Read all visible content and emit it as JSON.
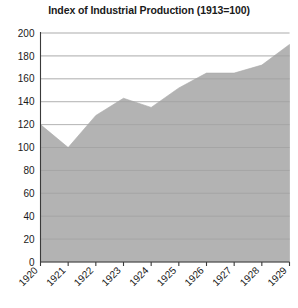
{
  "chart_data": {
    "type": "area",
    "title": "Index of Industrial Production (1913=100)",
    "xlabel": "",
    "ylabel": "",
    "categories": [
      "1920",
      "1921",
      "1922",
      "1923",
      "1924",
      "1925",
      "1926",
      "1927",
      "1928",
      "1929"
    ],
    "values": [
      120,
      100,
      128,
      143,
      135,
      152,
      165,
      165,
      172,
      190
    ],
    "ylim": [
      0,
      200
    ],
    "ytick_values": [
      0,
      20,
      40,
      60,
      80,
      100,
      120,
      140,
      160,
      180,
      200
    ],
    "ytick_labels": [
      "0",
      "20",
      "40",
      "60",
      "80",
      "100",
      "120",
      "140",
      "160",
      "180",
      "200"
    ],
    "grid": true,
    "legend": false,
    "legend_position": "none",
    "xtick_rotation_degrees": 45,
    "colors": {
      "area_fill": "#a9a9a9",
      "gridline": "#b9b9b9",
      "axis": "#3a3a3a",
      "text": "#1a1a1a",
      "background": "#ffffff"
    }
  }
}
